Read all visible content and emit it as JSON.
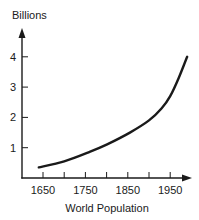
{
  "chart_data": {
    "type": "line",
    "title": "",
    "xlabel": "World Population",
    "ylabel": "Billions",
    "x_ticks": [
      1650,
      1700,
      1750,
      1800,
      1850,
      1900,
      1950
    ],
    "x_tick_labels": [
      "1650",
      "1750",
      "1850",
      "1950"
    ],
    "y_ticks": [
      1,
      2,
      3,
      4
    ],
    "y_tick_labels": [
      "1",
      "2",
      "3",
      "4"
    ],
    "xlim": [
      1600,
      2000
    ],
    "ylim": [
      0,
      4.6
    ],
    "grid": false,
    "legend": null,
    "series": [
      {
        "name": "World Population",
        "x": [
          1640,
          1700,
          1760,
          1800,
          1855,
          1900,
          1930,
          1950,
          1970,
          1990
        ],
        "values": [
          0.35,
          0.55,
          0.86,
          1.1,
          1.5,
          1.9,
          2.3,
          2.7,
          3.3,
          4.0
        ]
      }
    ]
  },
  "labels": {
    "ylabel": "Billions",
    "xlabel": "World Population"
  }
}
